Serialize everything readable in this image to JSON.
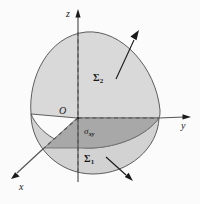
{
  "figure": {
    "background_color": "#fbfbfb",
    "stroke_color": "#4d4d4d",
    "label_color": "#1a1a1a",
    "upper_surface_fill": "#d9d9d9",
    "lower_surface_fill": "#d2d2d2",
    "projection_fill": "#a8a8a8",
    "axes": {
      "z": {
        "label": "z",
        "direction": "up"
      },
      "y": {
        "label": "y",
        "direction": "right"
      },
      "x": {
        "label": "x",
        "direction": "down-left"
      },
      "origin": {
        "label": "O"
      }
    },
    "regions": {
      "upper_surface": {
        "label": "Σ",
        "subscript": "2"
      },
      "lower_surface": {
        "label": "Σ",
        "subscript": "1"
      },
      "projection": {
        "label": "σ",
        "subscript": "xy"
      }
    },
    "normals": [
      {
        "name": "upper-normal-arrow",
        "from": [
          116,
          79
        ],
        "to": [
          139,
          33
        ]
      },
      {
        "name": "lower-normal-arrow",
        "from": [
          106,
          157
        ],
        "to": [
          131,
          180
        ]
      }
    ]
  }
}
